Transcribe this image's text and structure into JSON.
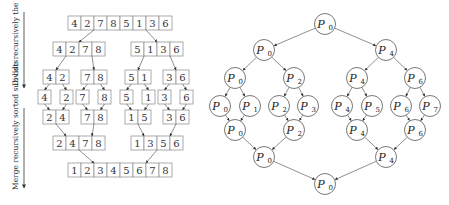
{
  "left_diagram": {
    "title": "merge-sort",
    "side_labels": {
      "divide": "Divide recursively the data",
      "merge": "Merge recursively sorted sub-lists"
    },
    "rows": [
      {
        "level": "input",
        "y": 16,
        "groups": [
          {
            "x": 68,
            "values": [
              4,
              2,
              7,
              8,
              5,
              1,
              3,
              6
            ]
          }
        ]
      },
      {
        "level": "divide-1",
        "y": 42,
        "groups": [
          {
            "x": 53,
            "values": [
              4,
              2,
              7,
              8
            ]
          },
          {
            "x": 131,
            "values": [
              5,
              1,
              3,
              6
            ]
          }
        ]
      },
      {
        "level": "divide-2",
        "y": 70,
        "groups": [
          {
            "x": 43,
            "values": [
              4,
              2
            ]
          },
          {
            "x": 81,
            "values": [
              7,
              8
            ]
          },
          {
            "x": 125,
            "values": [
              5,
              1
            ]
          },
          {
            "x": 163,
            "values": [
              3,
              6
            ]
          }
        ]
      },
      {
        "level": "singles",
        "y": 90,
        "groups": [
          {
            "x": 38,
            "values": [
              4
            ]
          },
          {
            "x": 60,
            "values": [
              2
            ]
          },
          {
            "x": 76,
            "values": [
              7
            ]
          },
          {
            "x": 98,
            "values": [
              8
            ]
          },
          {
            "x": 120,
            "values": [
              5
            ]
          },
          {
            "x": 142,
            "values": [
              1
            ]
          },
          {
            "x": 158,
            "values": [
              3
            ]
          },
          {
            "x": 180,
            "values": [
              6
            ]
          }
        ]
      },
      {
        "level": "merge-1",
        "y": 110,
        "groups": [
          {
            "x": 43,
            "values": [
              2,
              4
            ]
          },
          {
            "x": 81,
            "values": [
              7,
              8
            ]
          },
          {
            "x": 125,
            "values": [
              1,
              5
            ]
          },
          {
            "x": 163,
            "values": [
              3,
              6
            ]
          }
        ]
      },
      {
        "level": "merge-2",
        "y": 136,
        "groups": [
          {
            "x": 53,
            "values": [
              2,
              4,
              7,
              8
            ]
          },
          {
            "x": 131,
            "values": [
              1,
              3,
              5,
              6
            ]
          }
        ]
      },
      {
        "level": "output",
        "y": 163,
        "groups": [
          {
            "x": 68,
            "values": [
              1,
              2,
              3,
              4,
              5,
              6,
              7,
              8
            ]
          }
        ]
      }
    ]
  },
  "right_diagram": {
    "title": "process-tree",
    "nodes": [
      {
        "id": "r0",
        "label": "P",
        "sub": "0",
        "x": 325,
        "y": 24
      },
      {
        "id": "a0",
        "label": "P",
        "sub": "0",
        "x": 264,
        "y": 50
      },
      {
        "id": "a4",
        "label": "P",
        "sub": "4",
        "x": 386,
        "y": 50
      },
      {
        "id": "b0",
        "label": "P",
        "sub": "0",
        "x": 235,
        "y": 78
      },
      {
        "id": "b2",
        "label": "P",
        "sub": "2",
        "x": 294,
        "y": 78
      },
      {
        "id": "b4",
        "label": "P",
        "sub": "4",
        "x": 357,
        "y": 78
      },
      {
        "id": "b6",
        "label": "P",
        "sub": "6",
        "x": 415,
        "y": 78
      },
      {
        "id": "c0",
        "label": "P",
        "sub": "0",
        "x": 220,
        "y": 106
      },
      {
        "id": "c1",
        "label": "P",
        "sub": "1",
        "x": 250,
        "y": 106
      },
      {
        "id": "c2",
        "label": "P",
        "sub": "2",
        "x": 279,
        "y": 106
      },
      {
        "id": "c3",
        "label": "P",
        "sub": "3",
        "x": 308,
        "y": 106
      },
      {
        "id": "c4",
        "label": "P",
        "sub": "4",
        "x": 342,
        "y": 106
      },
      {
        "id": "c5",
        "label": "P",
        "sub": "5",
        "x": 372,
        "y": 106
      },
      {
        "id": "c6",
        "label": "P",
        "sub": "6",
        "x": 401,
        "y": 106
      },
      {
        "id": "c7",
        "label": "P",
        "sub": "7",
        "x": 430,
        "y": 106
      },
      {
        "id": "d0",
        "label": "P",
        "sub": "0",
        "x": 235,
        "y": 130
      },
      {
        "id": "d2",
        "label": "P",
        "sub": "2",
        "x": 294,
        "y": 130
      },
      {
        "id": "d4",
        "label": "P",
        "sub": "4",
        "x": 357,
        "y": 130
      },
      {
        "id": "d6",
        "label": "P",
        "sub": "6",
        "x": 415,
        "y": 130
      },
      {
        "id": "e0",
        "label": "P",
        "sub": "0",
        "x": 264,
        "y": 157
      },
      {
        "id": "e4",
        "label": "P",
        "sub": "4",
        "x": 386,
        "y": 157
      },
      {
        "id": "f0",
        "label": "P",
        "sub": "0",
        "x": 325,
        "y": 184
      }
    ],
    "edges": [
      [
        "r0",
        "a0"
      ],
      [
        "r0",
        "a4"
      ],
      [
        "a0",
        "b0"
      ],
      [
        "a0",
        "b2"
      ],
      [
        "a4",
        "b4"
      ],
      [
        "a4",
        "b6"
      ],
      [
        "b0",
        "c0"
      ],
      [
        "b0",
        "c1"
      ],
      [
        "b2",
        "c2"
      ],
      [
        "b2",
        "c3"
      ],
      [
        "b4",
        "c4"
      ],
      [
        "b4",
        "c5"
      ],
      [
        "b6",
        "c6"
      ],
      [
        "b6",
        "c7"
      ],
      [
        "c0",
        "d0"
      ],
      [
        "c1",
        "d0"
      ],
      [
        "c2",
        "d2"
      ],
      [
        "c3",
        "d2"
      ],
      [
        "c4",
        "d4"
      ],
      [
        "c5",
        "d4"
      ],
      [
        "c6",
        "d6"
      ],
      [
        "c7",
        "d6"
      ],
      [
        "d0",
        "e0"
      ],
      [
        "d2",
        "e0"
      ],
      [
        "d4",
        "e4"
      ],
      [
        "d6",
        "e4"
      ],
      [
        "e0",
        "f0"
      ],
      [
        "e4",
        "f0"
      ]
    ]
  }
}
